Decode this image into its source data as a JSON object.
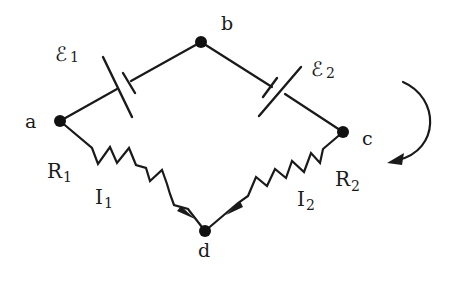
{
  "diagram": {
    "type": "circuit",
    "nodes": [
      {
        "id": "a",
        "label": "a",
        "x": 60,
        "y": 121
      },
      {
        "id": "b",
        "label": "b",
        "x": 201,
        "y": 42
      },
      {
        "id": "c",
        "label": "c",
        "x": 343,
        "y": 132
      },
      {
        "id": "d",
        "label": "d",
        "x": 205,
        "y": 231
      }
    ],
    "components": {
      "emf1": {
        "symbol": "ℰ",
        "subscript": "1",
        "between": [
          "a",
          "b"
        ],
        "type": "battery"
      },
      "emf2": {
        "symbol": "ℰ",
        "subscript": "2",
        "between": [
          "b",
          "c"
        ],
        "type": "battery"
      },
      "r1": {
        "symbol": "R",
        "subscript": "1",
        "between": [
          "a",
          "d"
        ],
        "type": "resistor"
      },
      "r2": {
        "symbol": "R",
        "subscript": "2",
        "between": [
          "c",
          "d"
        ],
        "type": "resistor"
      }
    },
    "currents": {
      "i1": {
        "symbol": "I",
        "subscript": "1",
        "direction": "a → d"
      },
      "i2": {
        "symbol": "I",
        "subscript": "2",
        "direction": "c → d"
      }
    },
    "loop_direction": {
      "direction": "clockwise",
      "icon": "curved-arrow-icon"
    },
    "colors": {
      "ink": "#1a1a1a",
      "background": "#ffffff"
    }
  }
}
